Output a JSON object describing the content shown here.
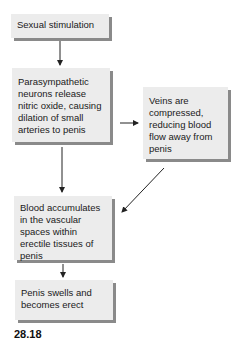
{
  "diagram": {
    "type": "flowchart",
    "nodes": [
      {
        "id": "n1",
        "label": "Sexual stimulation"
      },
      {
        "id": "n2",
        "label": "Parasympathetic neurons release nitric oxide, causing dilation of small arteries to penis"
      },
      {
        "id": "n3",
        "label": "Veins are compressed, reducing blood flow away from penis"
      },
      {
        "id": "n4",
        "label": "Blood accumulates in the vascular spaces within erectile tissues of penis"
      },
      {
        "id": "n5",
        "label": "Penis swells and becomes erect"
      }
    ],
    "edges": [
      {
        "from": "n1",
        "to": "n2"
      },
      {
        "from": "n2",
        "to": "n3"
      },
      {
        "from": "n2",
        "to": "n4"
      },
      {
        "from": "n3",
        "to": "n4"
      },
      {
        "from": "n4",
        "to": "n5"
      }
    ],
    "figure_label": "28.18"
  },
  "colors": {
    "box_fill": "#ececec",
    "box_shadow": "#8a8a8a",
    "arrow": "#222222"
  }
}
